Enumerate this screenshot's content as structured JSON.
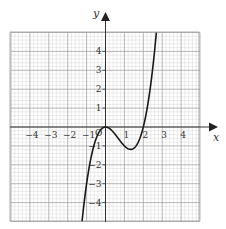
{
  "chart_data": {
    "type": "line",
    "title": "",
    "xlabel": "x",
    "ylabel": "y",
    "origin_label": "O",
    "xlim": [
      -5,
      5
    ],
    "ylim": [
      -5,
      5
    ],
    "grid": true,
    "grid_minor_per_unit": 5,
    "x_ticks": [
      -4,
      -3,
      -2,
      -1,
      1,
      2,
      3,
      4
    ],
    "x_tick_labels": [
      "−4",
      "−3",
      "−2",
      "−1",
      "1",
      "2",
      "3",
      "4"
    ],
    "y_ticks": [
      4,
      3,
      2,
      1,
      -1,
      -2,
      -3,
      -4
    ],
    "y_tick_labels": [
      "4",
      "3",
      "2",
      "1",
      "−1",
      "−2",
      "−3",
      "−4"
    ],
    "series": [
      {
        "name": "y = x^3 - 2x^2",
        "function": "x^3 - 2x^2",
        "x": [
          -1.24,
          -1.0,
          -0.75,
          -0.5,
          -0.25,
          0,
          0.25,
          0.5,
          0.75,
          1.0,
          1.25,
          1.333,
          1.5,
          1.75,
          2.0,
          2.25,
          2.5,
          2.69
        ],
        "values": [
          -5.0,
          -3.0,
          -1.55,
          -0.625,
          -0.14,
          0,
          -0.11,
          -0.375,
          -0.7,
          -1.0,
          -1.17,
          -1.185,
          -1.125,
          -0.77,
          0,
          1.27,
          3.125,
          5.0
        ]
      }
    ],
    "key_points": {
      "local_max": [
        0,
        0
      ],
      "local_min": [
        1.333,
        -1.185
      ],
      "x_intercepts": [
        0,
        2
      ]
    },
    "colors": {
      "curve": "#1a1a1a",
      "axis": "#333333",
      "grid_major": "#9a9a9a",
      "grid_minor": "#cfcfcf"
    }
  }
}
